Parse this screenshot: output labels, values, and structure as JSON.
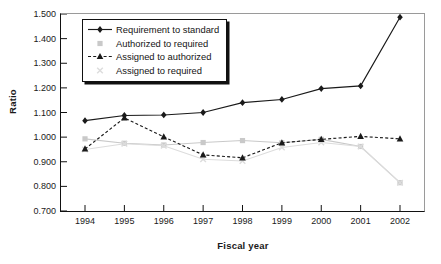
{
  "chart_data": {
    "type": "line",
    "title": "",
    "xlabel": "Fiscal year",
    "ylabel": "Ratio",
    "categories": [
      "1994",
      "1995",
      "1996",
      "1997",
      "1998",
      "1999",
      "2000",
      "2001",
      "2002"
    ],
    "x": [
      1994,
      1995,
      1996,
      1997,
      1998,
      1999,
      2000,
      2001,
      2002
    ],
    "ylim": [
      0.7,
      1.5
    ],
    "yticks": [
      "0.700",
      "0.800",
      "0.900",
      "1.000",
      "1.100",
      "1.200",
      "1.300",
      "1.400",
      "1.500"
    ],
    "ytick_values": [
      0.7,
      0.8,
      0.9,
      1.0,
      1.1,
      1.2,
      1.3,
      1.4,
      1.5
    ],
    "grid": false,
    "legend_position": "top-left",
    "series": [
      {
        "name": "Requirement to standard",
        "marker": "diamond",
        "linestyle": "solid",
        "color": "#1a1a1a",
        "values": [
          1.067,
          1.088,
          1.09,
          1.1,
          1.14,
          1.153,
          1.197,
          1.208,
          1.487
        ]
      },
      {
        "name": "Authorized to required",
        "marker": "square",
        "linestyle": "solid",
        "color": "#c9c9c9",
        "values": [
          0.993,
          0.975,
          0.968,
          0.978,
          0.986,
          0.977,
          0.991,
          0.962,
          0.815
        ]
      },
      {
        "name": "Assigned to authorized",
        "marker": "triangle",
        "linestyle": "dashed",
        "color": "#1a1a1a",
        "values": [
          0.952,
          1.078,
          1.001,
          0.928,
          0.916,
          0.977,
          0.991,
          1.003,
          0.993
        ]
      },
      {
        "name": "Assigned to required",
        "marker": "x",
        "linestyle": "solid",
        "color": "#dcdcdc",
        "values": [
          0.95,
          0.973,
          0.965,
          0.91,
          0.903,
          0.958,
          0.978,
          0.962,
          0.815
        ]
      }
    ]
  },
  "axis": {
    "ylabel": "Ratio",
    "xlabel": "Fiscal year"
  }
}
